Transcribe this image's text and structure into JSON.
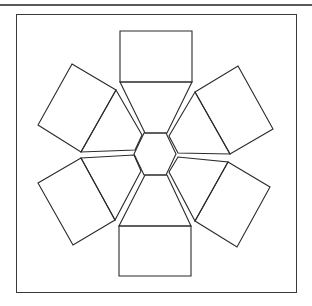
{
  "diagram": {
    "colors": {
      "stroke": "#2a2a2a",
      "background": "#ffffff",
      "frame": "#3a3a3a"
    },
    "top_rule": {
      "x1": 0,
      "y1": 5,
      "x2": 312,
      "y2": 5
    },
    "frame": {
      "x": 16,
      "y": 14,
      "width": 280,
      "height": 278
    },
    "hexagon": "144,133 166,133 176,154 166,175 144,175 134,154",
    "pieces": [
      {
        "name": "top",
        "trapezoid": "120,82 192,82 167,133 145,133",
        "rectangle": "120,31 192,31 192,82 120,82"
      },
      {
        "name": "upper-right",
        "trapezoid": "195,92 230,154 178,153 169,136",
        "rectangle": "195,92 238,66 273,129 230,154"
      },
      {
        "name": "lower-right",
        "trapezoid": "228,162 195,221 169,172 178,157",
        "rectangle": "228,162 270,187 237,247 195,221"
      },
      {
        "name": "bottom",
        "trapezoid": "145,175 167,175 191,226 119,226",
        "rectangle": "119,226 191,226 191,276 119,276"
      },
      {
        "name": "lower-left",
        "trapezoid": "81,158 134,155 141,171 115,220",
        "rectangle": "81,158 115,220 73,245 38,183"
      },
      {
        "name": "upper-left",
        "trapezoid": "116,90 142,135 135,150 81,152",
        "rectangle": "72,64 116,90 81,152 38,125"
      }
    ]
  }
}
